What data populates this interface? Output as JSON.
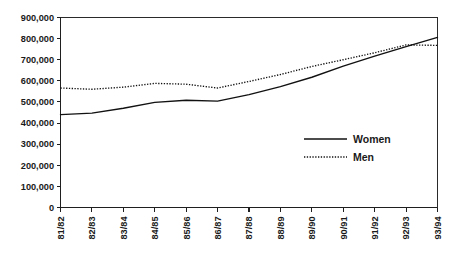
{
  "chart_data": {
    "type": "line",
    "title": "",
    "subtitle": "",
    "xlabel": "",
    "ylabel": "",
    "categories": [
      "81/82",
      "82/83",
      "83/84",
      "84/85",
      "85/86",
      "86/87",
      "87/88",
      "88/89",
      "89/90",
      "90/91",
      "91/92",
      "92/93",
      "93/94"
    ],
    "series": [
      {
        "name": "Women",
        "style": "solid",
        "values": [
          440000,
          447000,
          470000,
          498000,
          508000,
          504000,
          535000,
          573000,
          617000,
          670000,
          717000,
          762000,
          806000
        ]
      },
      {
        "name": "Men",
        "style": "dotted",
        "values": [
          566000,
          560000,
          570000,
          588000,
          584000,
          566000,
          597000,
          630000,
          668000,
          700000,
          733000,
          770000,
          768000
        ]
      }
    ],
    "ylim": [
      0,
      900000
    ],
    "yticks": [
      0,
      100000,
      200000,
      300000,
      400000,
      500000,
      600000,
      700000,
      800000,
      900000
    ],
    "ytick_labels": [
      "0",
      "100,000",
      "200,000",
      "300,000",
      "400,000",
      "500,000",
      "600,000",
      "700,000",
      "800,000",
      "900,000"
    ],
    "grid": false,
    "legend_position": "inside-right",
    "legend_entries": [
      {
        "label": "Women",
        "style": "solid"
      },
      {
        "label": "Men",
        "style": "dotted"
      }
    ],
    "colors": {
      "women_line": "#111111",
      "men_line": "#111111",
      "axis": "#1f1f1f",
      "background": "#ffffff",
      "text": "#1a1a1a"
    }
  }
}
